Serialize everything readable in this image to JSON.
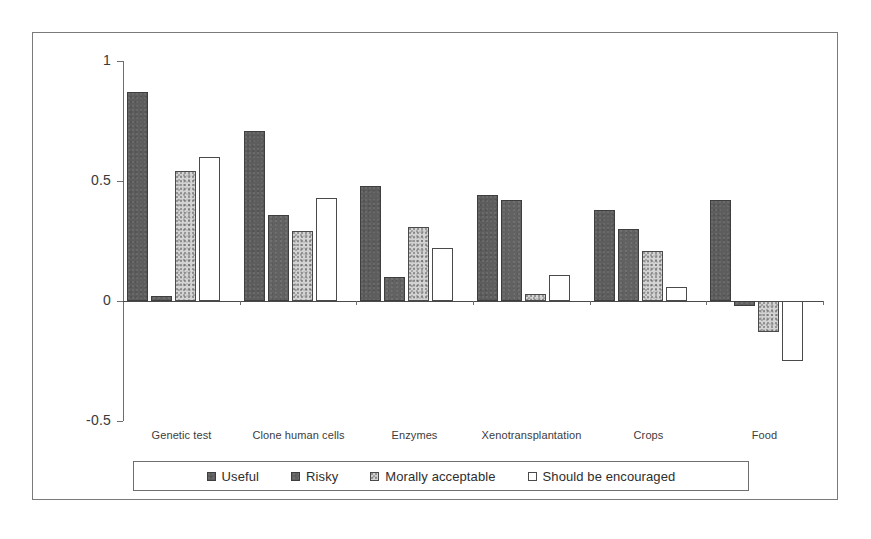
{
  "chart_data": {
    "type": "bar",
    "title": "",
    "subtitle": "",
    "xlabel": "",
    "ylabel": "",
    "ylim": [
      -0.5,
      1
    ],
    "grid": false,
    "legend_position": "bottom",
    "y_ticks": [
      "1",
      "0.5",
      "0",
      "-0.5"
    ],
    "y_tick_values": [
      1,
      0.5,
      0,
      -0.5
    ],
    "categories": [
      "Genetic test",
      "Clone human cells",
      "Enzymes",
      "Xenotransplantation",
      "Crops",
      "Food"
    ],
    "series": [
      {
        "name": "Useful",
        "color": "#5d5d5d",
        "values": [
          0.87,
          0.71,
          0.48,
          0.44,
          0.38,
          0.42
        ]
      },
      {
        "name": "Risky",
        "color": "#626262",
        "values": [
          0.02,
          0.36,
          0.1,
          0.42,
          0.3,
          -0.02
        ]
      },
      {
        "name": "Morally acceptable",
        "color": "#d3d3d3",
        "values": [
          0.54,
          0.29,
          0.31,
          0.03,
          0.21,
          -0.13
        ]
      },
      {
        "name": "Should be encouraged",
        "color": "#ffffff",
        "values": [
          0.6,
          0.43,
          0.22,
          0.11,
          0.06,
          -0.25
        ]
      }
    ]
  },
  "legend": {
    "items": [
      {
        "label": "Useful",
        "swatch": "useful"
      },
      {
        "label": "Risky",
        "swatch": "risky"
      },
      {
        "label": "Morally acceptable",
        "swatch": "morally"
      },
      {
        "label": "Should be encouraged",
        "swatch": "encouraged"
      }
    ]
  },
  "colors": {
    "frame_border": "#7a7a7a",
    "axis": "#6d6d6d",
    "zero_line": "#4a4a4a",
    "text": "#2b2b2b"
  }
}
